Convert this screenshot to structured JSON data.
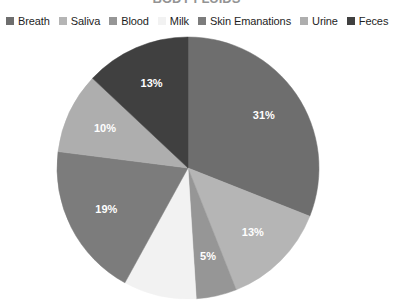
{
  "title_remnant": "BODY FLUIDS",
  "legend": {
    "position": "top",
    "items": [
      {
        "label": "Breath",
        "color": "#6e6e6e",
        "marker": "square-swatch"
      },
      {
        "label": "Saliva",
        "color": "#b5b5b5",
        "marker": "square-swatch"
      },
      {
        "label": "Blood",
        "color": "#969696",
        "marker": "square-swatch"
      },
      {
        "label": "Milk",
        "color": "#f2f2f2",
        "marker": "square-swatch"
      },
      {
        "label": "Skin Emanations",
        "color": "#7c7c7c",
        "marker": "square-swatch"
      },
      {
        "label": "Urine",
        "color": "#aeaeae",
        "marker": "square-swatch"
      },
      {
        "label": "Feces",
        "color": "#404040",
        "marker": "square-swatch"
      }
    ]
  },
  "chart_data": {
    "type": "pie",
    "title": "BODY FLUIDS",
    "xlabel": "",
    "ylabel": "",
    "grid": false,
    "legend_position": "top",
    "start_angle_deg": 0,
    "direction": "clockwise",
    "units": "percent",
    "categories": [
      "Breath",
      "Saliva",
      "Blood",
      "Milk",
      "Skin Emanations",
      "Urine",
      "Feces"
    ],
    "values": [
      31,
      13,
      5,
      9,
      19,
      10,
      13
    ],
    "colors": [
      "#6e6e6e",
      "#b5b5b5",
      "#969696",
      "#f2f2f2",
      "#7c7c7c",
      "#aeaeae",
      "#404040"
    ],
    "data_labels": [
      "31%",
      "13%",
      "5%",
      "",
      "19%",
      "10%",
      "13%"
    ],
    "slices": [
      {
        "name": "Breath",
        "value": 31,
        "label": "31%",
        "color": "#6e6e6e",
        "label_visible": true,
        "label_fill": "#ffffff"
      },
      {
        "name": "Saliva",
        "value": 13,
        "label": "13%",
        "color": "#b5b5b5",
        "label_visible": true,
        "label_fill": "#ffffff"
      },
      {
        "name": "Blood",
        "value": 5,
        "label": "5%",
        "color": "#969696",
        "label_visible": true,
        "label_fill": "#ffffff"
      },
      {
        "name": "Milk",
        "value": 9,
        "label": "9%",
        "color": "#f2f2f2",
        "label_visible": false,
        "label_fill": "#ffffff"
      },
      {
        "name": "Skin Emanations",
        "value": 19,
        "label": "19%",
        "color": "#7c7c7c",
        "label_visible": true,
        "label_fill": "#ffffff"
      },
      {
        "name": "Urine",
        "value": 10,
        "label": "10%",
        "color": "#aeaeae",
        "label_visible": true,
        "label_fill": "#ffffff"
      },
      {
        "name": "Feces",
        "value": 13,
        "label": "13%",
        "color": "#404040",
        "label_visible": true,
        "label_fill": "#ffffff"
      }
    ]
  },
  "geometry": {
    "center_x": 188,
    "center_y": 168,
    "radius": 131
  }
}
